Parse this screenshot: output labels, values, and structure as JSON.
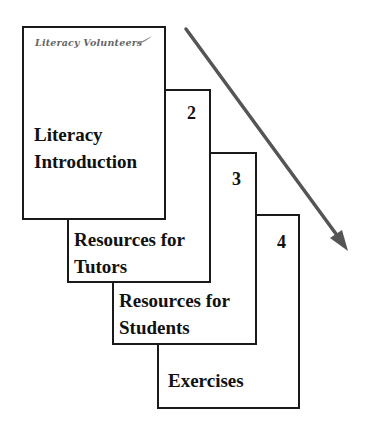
{
  "diagram": {
    "logo_text": "Literacy Volunteers",
    "cards": [
      {
        "number": "",
        "title_line1": "Literacy",
        "title_line2": "Introduction"
      },
      {
        "number": "2",
        "title_line1": "Resources for",
        "title_line2": "Tutors"
      },
      {
        "number": "3",
        "title_line1": "Resources for",
        "title_line2": "Students"
      },
      {
        "number": "4",
        "title_line1": "Exercises",
        "title_line2": ""
      }
    ],
    "arrow": {
      "direction": "down-right",
      "color": "#555555"
    },
    "colors": {
      "border": "#1a1a1a",
      "text": "#111111",
      "logo": "#666666",
      "background": "#ffffff"
    }
  }
}
